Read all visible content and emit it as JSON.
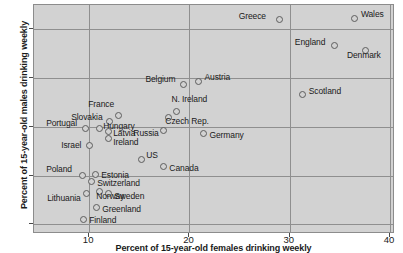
{
  "chart_data": {
    "type": "scatter",
    "title": "",
    "xlabel": "Percent of 15-year-old females drinking weekly",
    "ylabel": "Percent of 15-year-old males drinking weekly",
    "xlim": [
      4.5,
      40.5
    ],
    "ylim": [
      8,
      55
    ],
    "xticks": [
      10,
      20,
      30,
      40
    ],
    "yticks": [
      10,
      20,
      30,
      40,
      50
    ],
    "grid": true,
    "legend": "none",
    "marker_color": "#5d5d5d",
    "plot_background": "#d2d2d2",
    "points": [
      {
        "label": "Greece",
        "x": 29.0,
        "y": 52.0,
        "lx": -41,
        "ly": -5
      },
      {
        "label": "Wales",
        "x": 36.5,
        "y": 52.3,
        "lx": 6,
        "ly": -5
      },
      {
        "label": "England",
        "x": 34.5,
        "y": 46.6,
        "lx": -40,
        "ly": -5
      },
      {
        "label": "Denmark",
        "x": 37.6,
        "y": 45.6,
        "lx": -19,
        "ly": 3
      },
      {
        "label": "Austria",
        "x": 20.9,
        "y": 39.4,
        "lx": 6,
        "ly": -5
      },
      {
        "label": "Belgium",
        "x": 19.4,
        "y": 38.7,
        "lx": -38,
        "ly": -6
      },
      {
        "label": "Scotland",
        "x": 31.3,
        "y": 36.6,
        "lx": 6,
        "ly": -5
      },
      {
        "label": "N. Ireland",
        "x": 18.7,
        "y": 33.2,
        "lx": -5,
        "ly": -13
      },
      {
        "label": "France",
        "x": 12.9,
        "y": 32.3,
        "lx": -30,
        "ly": -13
      },
      {
        "label": "Slovakia",
        "x": 12.0,
        "y": 31.1,
        "lx": -38,
        "ly": -5
      },
      {
        "label": "Czech Rep.",
        "x": 17.9,
        "y": 31.9,
        "lx": -3,
        "ly": 2
      },
      {
        "label": "Portugal",
        "x": 9.6,
        "y": 29.7,
        "lx": -39,
        "ly": -6
      },
      {
        "label": "Hungary",
        "x": 11.0,
        "y": 29.6,
        "lx": 4,
        "ly": -4
      },
      {
        "label": "Latvia",
        "x": 11.9,
        "y": 29.0,
        "lx": 5,
        "ly": 0
      },
      {
        "label": "Ireland",
        "x": 11.9,
        "y": 27.5,
        "lx": 5,
        "ly": 2
      },
      {
        "label": "Russia",
        "x": 17.4,
        "y": 29.3,
        "lx": -30,
        "ly": 2
      },
      {
        "label": "Germany",
        "x": 21.4,
        "y": 28.6,
        "lx": 6,
        "ly": 0
      },
      {
        "label": "Israel",
        "x": 10.0,
        "y": 26.2,
        "lx": -28,
        "ly": -1
      },
      {
        "label": "US",
        "x": 15.2,
        "y": 23.2,
        "lx": 5,
        "ly": -6
      },
      {
        "label": "Canada",
        "x": 17.4,
        "y": 21.8,
        "lx": 6,
        "ly": 0
      },
      {
        "label": "Poland",
        "x": 9.3,
        "y": 20.1,
        "lx": -36,
        "ly": -7
      },
      {
        "label": "Estonia",
        "x": 10.6,
        "y": 20.3,
        "lx": 6,
        "ly": 0
      },
      {
        "label": "Switzerland",
        "x": 10.2,
        "y": 18.7,
        "lx": 6,
        "ly": 0
      },
      {
        "label": "Sweden",
        "x": 11.9,
        "y": 16.3,
        "lx": 6,
        "ly": 1
      },
      {
        "label": "Norway",
        "x": 11.0,
        "y": 16.8,
        "lx": -3,
        "ly": 4
      },
      {
        "label": "Lithuania",
        "x": 9.7,
        "y": 16.4,
        "lx": -39,
        "ly": 4
      },
      {
        "label": "Greenland",
        "x": 10.7,
        "y": 13.4,
        "lx": 6,
        "ly": 0
      },
      {
        "label": "Finland",
        "x": 9.4,
        "y": 11.0,
        "lx": 6,
        "ly": 0
      }
    ]
  }
}
